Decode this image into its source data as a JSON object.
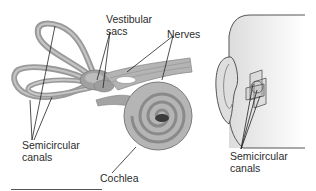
{
  "diagram": {
    "left_panel": {
      "subject": "inner-ear",
      "labels": {
        "vestibular_sacs": [
          "Vestibular",
          "sacs"
        ],
        "nerves": "Nerves",
        "semicircular_canals": [
          "Semicircular",
          "canals"
        ],
        "cochlea": "Cochlea"
      }
    },
    "right_panel": {
      "subject": "head-profile-with-ear",
      "labels": {
        "semicircular_canals": [
          "Semicircular",
          "canals"
        ]
      }
    },
    "colors": {
      "structure_fill": "#a9a9a9",
      "structure_stroke": "#7a7a7a",
      "head_fill": "#efefef",
      "line": "#222222",
      "text": "#2b2b2b"
    }
  }
}
